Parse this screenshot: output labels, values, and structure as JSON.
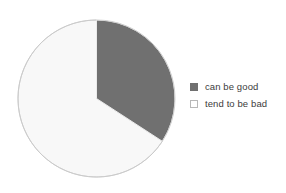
{
  "chart_data": {
    "type": "pie",
    "title": "",
    "subtitle": "",
    "xlabel": "",
    "ylabel": "",
    "grid": false,
    "legend_position": "right",
    "start_angle_deg": 0,
    "direction": "clockwise",
    "categories": [
      "can be good",
      "tend to be bad"
    ],
    "values": [
      34,
      66
    ],
    "value_unit": "percent",
    "slices": [
      {
        "label": "can be good",
        "value": 34,
        "start_angle_deg": 0,
        "end_angle_deg": 123,
        "fill": "#707070",
        "stroke": "#ffffff"
      },
      {
        "label": "tend to be bad",
        "value": 66,
        "start_angle_deg": 123,
        "end_angle_deg": 360,
        "fill": "#f8f8f8",
        "stroke": "#c9c9c9"
      }
    ],
    "annotations": []
  },
  "pie": {
    "center_x": 79.5,
    "center_y": 79.5,
    "radius": 78.5,
    "outline_color": "#c9c9c9"
  },
  "legend": {
    "items": [
      {
        "label": "can be good",
        "swatch_fill": "#707070",
        "swatch_border": "#707070"
      },
      {
        "label": "tend to be bad",
        "swatch_fill": "#ffffff",
        "swatch_border": "#b8b8b8"
      }
    ]
  },
  "colors": {
    "background": "#ffffff",
    "series_dark": "#707070",
    "series_light": "#f8f8f8",
    "outline": "#c9c9c9",
    "text": "#3c3c3c"
  }
}
